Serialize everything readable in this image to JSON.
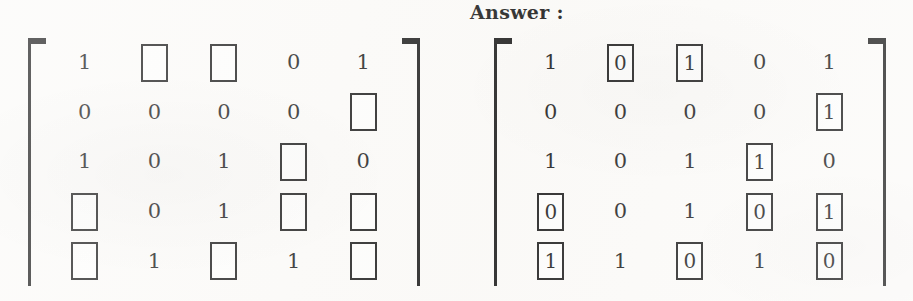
{
  "heading": {
    "answer_label": "Answer :"
  },
  "matrices": [
    {
      "id": "question",
      "name": "question-matrix",
      "rows": 5,
      "cols": 5,
      "cells": [
        [
          {
            "value": "1",
            "boxed": false
          },
          {
            "value": "",
            "boxed": true
          },
          {
            "value": "",
            "boxed": true
          },
          {
            "value": "0",
            "boxed": false
          },
          {
            "value": "1",
            "boxed": false
          }
        ],
        [
          {
            "value": "0",
            "boxed": false
          },
          {
            "value": "0",
            "boxed": false
          },
          {
            "value": "0",
            "boxed": false
          },
          {
            "value": "0",
            "boxed": false
          },
          {
            "value": "",
            "boxed": true
          }
        ],
        [
          {
            "value": "1",
            "boxed": false
          },
          {
            "value": "0",
            "boxed": false
          },
          {
            "value": "1",
            "boxed": false
          },
          {
            "value": "",
            "boxed": true
          },
          {
            "value": "0",
            "boxed": false
          }
        ],
        [
          {
            "value": "",
            "boxed": true
          },
          {
            "value": "0",
            "boxed": false
          },
          {
            "value": "1",
            "boxed": false
          },
          {
            "value": "",
            "boxed": true
          },
          {
            "value": "",
            "boxed": true
          }
        ],
        [
          {
            "value": "",
            "boxed": true
          },
          {
            "value": "1",
            "boxed": false
          },
          {
            "value": "",
            "boxed": true
          },
          {
            "value": "1",
            "boxed": false
          },
          {
            "value": "",
            "boxed": true
          }
        ]
      ]
    },
    {
      "id": "answer",
      "name": "answer-matrix",
      "rows": 5,
      "cols": 5,
      "cells": [
        [
          {
            "value": "1",
            "boxed": false
          },
          {
            "value": "0",
            "boxed": true
          },
          {
            "value": "1",
            "boxed": true
          },
          {
            "value": "0",
            "boxed": false
          },
          {
            "value": "1",
            "boxed": false
          }
        ],
        [
          {
            "value": "0",
            "boxed": false
          },
          {
            "value": "0",
            "boxed": false
          },
          {
            "value": "0",
            "boxed": false
          },
          {
            "value": "0",
            "boxed": false
          },
          {
            "value": "1",
            "boxed": true
          }
        ],
        [
          {
            "value": "1",
            "boxed": false
          },
          {
            "value": "0",
            "boxed": false
          },
          {
            "value": "1",
            "boxed": false
          },
          {
            "value": "1",
            "boxed": true
          },
          {
            "value": "0",
            "boxed": false
          }
        ],
        [
          {
            "value": "0",
            "boxed": true
          },
          {
            "value": "0",
            "boxed": false
          },
          {
            "value": "1",
            "boxed": false
          },
          {
            "value": "0",
            "boxed": true
          },
          {
            "value": "1",
            "boxed": true
          }
        ],
        [
          {
            "value": "1",
            "boxed": true
          },
          {
            "value": "1",
            "boxed": false
          },
          {
            "value": "0",
            "boxed": true
          },
          {
            "value": "1",
            "boxed": false
          },
          {
            "value": "0",
            "boxed": true
          }
        ]
      ]
    }
  ],
  "colors": {
    "ink": "#141414",
    "paper": "#fbfaf8"
  }
}
